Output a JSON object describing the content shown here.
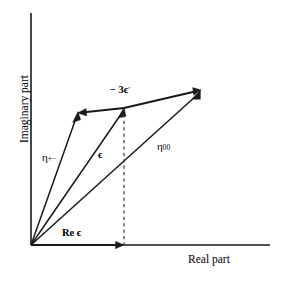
{
  "figure": {
    "type": "vector-diagram",
    "background_color": "#ffffff",
    "line_color": "#1a1a1a",
    "dashed_color": "#3a3a3a"
  },
  "axes": {
    "x_label": "Real part",
    "y_label": "Imaginary part",
    "origin": {
      "x": 31,
      "y": 245
    },
    "x_axis_end": {
      "x": 270,
      "y": 245
    },
    "y_axis_top": {
      "x": 31,
      "y": 13
    }
  },
  "vectors": [
    {
      "id": "eta-plus-minus",
      "label_base": "η",
      "label_sub": "+−",
      "label_x": 44,
      "label_y": 157,
      "from": {
        "x": 31,
        "y": 245
      },
      "to": {
        "x": 78,
        "y": 113
      }
    },
    {
      "id": "epsilon",
      "label_base": "ϵ",
      "label_sub": "",
      "label_x": 100,
      "label_y": 152,
      "from": {
        "x": 31,
        "y": 245
      },
      "to": {
        "x": 124,
        "y": 108
      }
    },
    {
      "id": "eta-zero-zero",
      "label_base": "η",
      "label_sub": "00",
      "label_x": 160,
      "label_y": 148,
      "from": {
        "x": 31,
        "y": 245
      },
      "to": {
        "x": 200,
        "y": 90
      }
    }
  ],
  "connectors": [
    {
      "id": "minus-three-epsilon-prime-left",
      "label_base": "− 3ϵ",
      "label_prime": "′",
      "label_x": 113,
      "label_y": 89,
      "from": {
        "x": 124,
        "y": 108
      },
      "to": {
        "x": 78,
        "y": 113
      }
    },
    {
      "id": "minus-three-epsilon-prime-right",
      "from": {
        "x": 124,
        "y": 108
      },
      "to": {
        "x": 200,
        "y": 90
      }
    }
  ],
  "real_part_arrow": {
    "label": "Re ϵ",
    "label_x": 64,
    "label_y": 233,
    "from": {
      "x": 31,
      "y": 245
    },
    "to": {
      "x": 124,
      "y": 245
    }
  },
  "projection_line": {
    "id": "epsilon-projection",
    "from": {
      "x": 124,
      "y": 108
    },
    "to": {
      "x": 124,
      "y": 245
    }
  }
}
